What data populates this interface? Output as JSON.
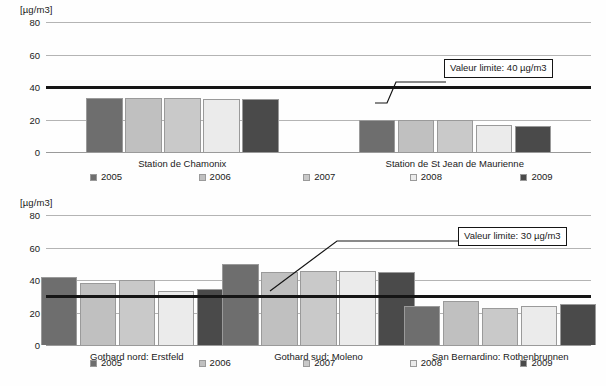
{
  "series_colors": {
    "2005": "#6e6e6e",
    "2006": "#c0c0c0",
    "2007": "#c9c9c9",
    "2008": "#ebebeb",
    "2009": "#4a4a4a",
    "border": "#9a9a9a",
    "limit_line": "#151515",
    "grid": "#b4b4b4"
  },
  "legend": {
    "items": [
      {
        "label": "2005",
        "color": "#6e6e6e"
      },
      {
        "label": "2006",
        "color": "#c0c0c0"
      },
      {
        "label": "2007",
        "color": "#c9c9c9"
      },
      {
        "label": "2008",
        "color": "#ebebeb"
      },
      {
        "label": "2009",
        "color": "#4a4a4a"
      }
    ]
  },
  "chart_data": [
    {
      "id": "top",
      "type": "bar",
      "title": "",
      "ylabel": "[µg/m3]",
      "xlabel": "",
      "ylim": [
        0,
        80
      ],
      "yticks": [
        0,
        20,
        40,
        60,
        80
      ],
      "ytick_labels": [
        "0",
        "20",
        "40",
        "60",
        "80"
      ],
      "grid": true,
      "legend_position": "bottom",
      "categories": [
        "Station de Chamonix",
        "Station de St Jean de Maurienne"
      ],
      "series": [
        {
          "name": "2005",
          "values": [
            33,
            20
          ]
        },
        {
          "name": "2006",
          "values": [
            33.5,
            20
          ]
        },
        {
          "name": "2007",
          "values": [
            33.5,
            20
          ]
        },
        {
          "name": "2008",
          "values": [
            32.5,
            16.5
          ]
        },
        {
          "name": "2009",
          "values": [
            32.5,
            16
          ]
        }
      ],
      "annotations": [
        {
          "text": "Valeur limite: 40 µg/m3",
          "value": 40
        }
      ]
    },
    {
      "id": "bottom",
      "type": "bar",
      "title": "",
      "ylabel": "[µg/m3]",
      "xlabel": "",
      "ylim": [
        0,
        80
      ],
      "yticks": [
        0,
        20,
        40,
        60,
        80
      ],
      "ytick_labels": [
        "0",
        "20",
        "40",
        "60",
        "80"
      ],
      "grid": true,
      "legend_position": "bottom",
      "categories": [
        "Gothard nord: Erstfeld",
        "Gothard sud: Moleno",
        "San Bernardino: Rothenbrunnen"
      ],
      "series": [
        {
          "name": "2005",
          "values": [
            42,
            50,
            24
          ]
        },
        {
          "name": "2006",
          "values": [
            38,
            45,
            27
          ]
        },
        {
          "name": "2007",
          "values": [
            40,
            45.5,
            23
          ]
        },
        {
          "name": "2008",
          "values": [
            33,
            45.5,
            24
          ]
        },
        {
          "name": "2009",
          "values": [
            34.5,
            45,
            25
          ]
        }
      ],
      "annotations": [
        {
          "text": "Valeur limite: 30 µg/m3",
          "value": 30
        }
      ]
    }
  ]
}
